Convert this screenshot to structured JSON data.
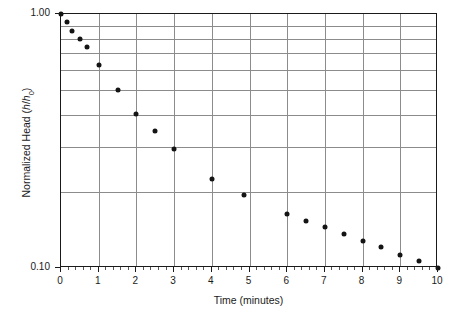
{
  "chart_data": {
    "type": "scatter",
    "title": "",
    "xlabel": "Time (minutes)",
    "ylabel": "Normalized Head (h/h0)",
    "ylabel_parts": {
      "prefix": "Normalized Head (",
      "italic_h1": "h",
      "slash": "/",
      "italic_h2": "h",
      "subscript": "0",
      "suffix": ")"
    },
    "xlim": [
      0,
      10
    ],
    "ylim": [
      0.1,
      1.0
    ],
    "yscale": "log",
    "xscale": "linear",
    "grid": true,
    "legend": null,
    "x": [
      0.0,
      0.15,
      0.3,
      0.5,
      0.7,
      1.0,
      1.5,
      2.0,
      2.5,
      3.0,
      4.0,
      4.85,
      6.0,
      6.5,
      7.0,
      7.5,
      8.0,
      8.5,
      9.0,
      9.5,
      10.0
    ],
    "y": [
      1.0,
      0.93,
      0.86,
      0.8,
      0.74,
      0.63,
      0.5,
      0.405,
      0.345,
      0.295,
      0.225,
      0.193,
      0.163,
      0.153,
      0.145,
      0.136,
      0.128,
      0.121,
      0.113,
      0.107,
      0.1
    ],
    "xticks": [
      0,
      1,
      2,
      3,
      4,
      5,
      6,
      7,
      8,
      9,
      10
    ],
    "xtick_labels": [
      "0",
      "1",
      "2",
      "3",
      "4",
      "5",
      "6",
      "7",
      "8",
      "9",
      "10"
    ],
    "xminor_step": 0.2,
    "yticks": [
      1.0,
      0.1
    ],
    "ytick_labels": [
      "1.00",
      "0.10"
    ],
    "ygridlines": [
      0.9,
      0.8,
      0.7,
      0.6,
      0.5,
      0.4,
      0.3,
      0.2
    ],
    "marker": "filled-circle",
    "marker_color": "#141414",
    "grid_color": "#8c8c8c",
    "axis_color": "#1a1a1a",
    "background": "#ffffff"
  }
}
